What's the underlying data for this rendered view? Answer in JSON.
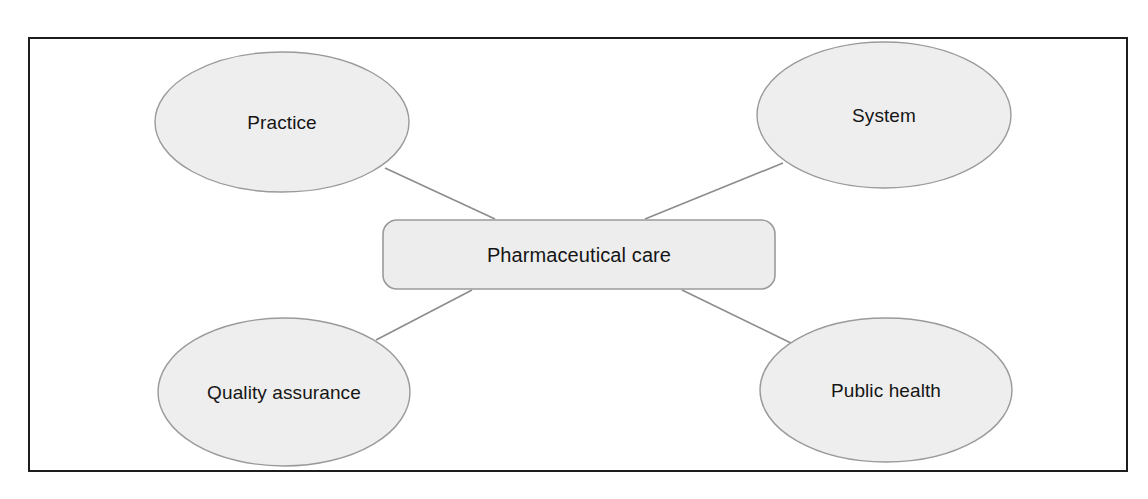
{
  "diagram": {
    "type": "concept-map",
    "title_text_visible": false,
    "frame": {
      "name": "outer-border",
      "x": 29,
      "y": 38,
      "width": 1098,
      "height": 433,
      "stroke": "#1d1d1d",
      "fill": "#ffffff",
      "stroke_width": 2
    },
    "style": {
      "node_fill": "#eeeeee",
      "node_stroke": "#9a9a9a",
      "center_fill": "#ededed",
      "center_stroke": "#9a9a9a",
      "connector_stroke": "#8c8c8c",
      "text_color": "#161616"
    },
    "center_node": {
      "name": "pharmaceutical-care",
      "label": "Pharmaceutical care",
      "shape": "rounded-rect",
      "x": 383,
      "y": 220,
      "width": 392,
      "height": 69,
      "radius": 14
    },
    "nodes": [
      {
        "name": "practice",
        "label": "Practice",
        "shape": "ellipse",
        "cx": 282,
        "cy": 122,
        "rx": 127,
        "ry": 70
      },
      {
        "name": "system",
        "label": "System",
        "shape": "ellipse",
        "cx": 884,
        "cy": 115,
        "rx": 127,
        "ry": 73
      },
      {
        "name": "quality-assurance",
        "label": "Quality assurance",
        "shape": "ellipse",
        "cx": 284,
        "cy": 392,
        "rx": 126,
        "ry": 74
      },
      {
        "name": "public-health",
        "label": "Public health",
        "shape": "ellipse",
        "cx": 886,
        "cy": 390,
        "rx": 126,
        "ry": 72
      }
    ],
    "connectors": [
      {
        "name": "connector-practice-to-center",
        "from": "practice",
        "to": "pharmaceutical-care",
        "x1": 385,
        "y1": 168,
        "x2": 495,
        "y2": 219
      },
      {
        "name": "connector-system-to-center",
        "from": "system",
        "to": "pharmaceutical-care",
        "x1": 783,
        "y1": 163,
        "x2": 645,
        "y2": 219
      },
      {
        "name": "connector-center-to-quality-assurance",
        "from": "pharmaceutical-care",
        "to": "quality-assurance",
        "x1": 472,
        "y1": 290,
        "x2": 376,
        "y2": 340
      },
      {
        "name": "connector-center-to-public-health",
        "from": "pharmaceutical-care",
        "to": "public-health",
        "x1": 682,
        "y1": 290,
        "x2": 795,
        "y2": 345
      }
    ]
  }
}
